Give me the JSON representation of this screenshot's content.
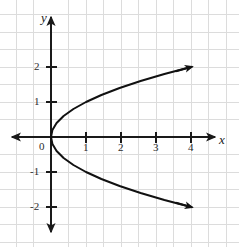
{
  "figure": {
    "title": "",
    "background_color": "#ffffff",
    "width": 239,
    "height": 247
  },
  "chart_data": {
    "type": "line",
    "title": "",
    "xlabel": "x",
    "ylabel": "y",
    "equation": "x = y^2",
    "orientation": "opens-right",
    "vertex": [
      0,
      0
    ],
    "xlim": [
      -1.45,
      5.1
    ],
    "ylim": [
      -3.1,
      3.15
    ],
    "xticks": [
      1,
      2,
      3,
      4
    ],
    "xticklabels": [
      "1",
      "2",
      "3",
      "4"
    ],
    "yticks": [
      2,
      1,
      -1,
      -2
    ],
    "yticklabels": [
      "2",
      "1",
      "-1",
      "-2"
    ],
    "origin_label": "0",
    "grid": true,
    "grid_spacing": 0.5,
    "grid_color": "#d9d9d9",
    "axis_color": "#1a1a1a",
    "curve_color": "#111111",
    "legend": "none",
    "series": [
      {
        "name": "x = y^2",
        "points": [
          [
            4.0,
            2.0
          ],
          [
            3.24,
            1.8
          ],
          [
            2.56,
            1.6
          ],
          [
            1.96,
            1.4
          ],
          [
            1.44,
            1.2
          ],
          [
            1.0,
            1.0
          ],
          [
            0.64,
            0.8
          ],
          [
            0.36,
            0.6
          ],
          [
            0.16,
            0.4
          ],
          [
            0.04,
            0.2
          ],
          [
            0.0,
            0.0
          ],
          [
            0.04,
            -0.2
          ],
          [
            0.16,
            -0.4
          ],
          [
            0.36,
            -0.6
          ],
          [
            0.64,
            -0.8
          ],
          [
            1.0,
            -1.0
          ],
          [
            1.44,
            -1.2
          ],
          [
            1.96,
            -1.4
          ],
          [
            2.56,
            -1.6
          ],
          [
            3.24,
            -1.8
          ],
          [
            4.0,
            -2.0
          ]
        ],
        "arrow_ends": [
          [
            4.0,
            2.0
          ],
          [
            4.0,
            -2.0
          ]
        ]
      }
    ]
  },
  "axis_labels": {
    "x": "x",
    "y": "y"
  },
  "tick_labels": {
    "x1": "1",
    "x2": "2",
    "x3": "3",
    "x4": "4",
    "y_pos2": "2",
    "y_pos1": "1",
    "y_neg1": "-1",
    "y_neg2": "-2",
    "origin": "0"
  }
}
